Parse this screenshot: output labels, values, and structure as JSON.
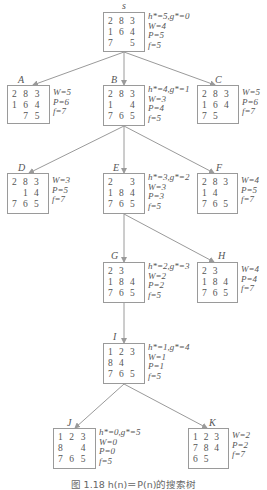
{
  "diagram": {
    "type": "search-tree",
    "caption": "图 1.18   h(n)＝P(n)的搜索树",
    "colors": {
      "edge": "#9a9a9a",
      "box_border": "#9a9a9a",
      "text": "#555555"
    },
    "nodes": [
      {
        "id": "S",
        "label": "s",
        "board": [
          [
            "2",
            "8",
            "3"
          ],
          [
            "1",
            "6",
            "4"
          ],
          [
            "7",
            "",
            "5"
          ]
        ],
        "stats": [
          "h*=5,g*=0",
          "W=4",
          "P=5",
          "f=5"
        ],
        "box": [
          103,
          12,
          42,
          40
        ],
        "labelPos": [
          122,
          1
        ]
      },
      {
        "id": "A",
        "label": "A",
        "board": [
          [
            "2",
            "8",
            "3"
          ],
          [
            "1",
            "6",
            "4"
          ],
          [
            "",
            "7",
            "5"
          ]
        ],
        "stats": [
          "W=5",
          "P=6",
          "f=7"
        ],
        "box": [
          7,
          85,
          43,
          39
        ],
        "labelPos": [
          18,
          75
        ]
      },
      {
        "id": "B",
        "label": "B",
        "board": [
          [
            "2",
            "8",
            "3"
          ],
          [
            "1",
            "",
            "4"
          ],
          [
            "7",
            "6",
            "5"
          ]
        ],
        "stats": [
          "h*=4,g*=1",
          "W=3",
          "P=4",
          "f=5"
        ],
        "box": [
          103,
          85,
          42,
          41
        ],
        "labelPos": [
          111,
          75
        ]
      },
      {
        "id": "C",
        "label": "C",
        "board": [
          [
            "2",
            "8",
            "3"
          ],
          [
            "1",
            "6",
            "4"
          ],
          [
            "7",
            "5",
            ""
          ]
        ],
        "stats": [
          "W=5",
          "P=6",
          "f=7"
        ],
        "box": [
          197,
          85,
          42,
          39
        ],
        "labelPos": [
          215,
          75
        ]
      },
      {
        "id": "D",
        "label": "D",
        "board": [
          [
            "2",
            "8",
            "3"
          ],
          [
            "",
            "1",
            "4"
          ],
          [
            "7",
            "6",
            "5"
          ]
        ],
        "stats": [
          "W=3",
          "P=5",
          "f=7"
        ],
        "box": [
          7,
          173,
          42,
          41
        ],
        "labelPos": [
          18,
          163
        ]
      },
      {
        "id": "E",
        "label": "E",
        "board": [
          [
            "2",
            "",
            "3"
          ],
          [
            "1",
            "8",
            "4"
          ],
          [
            "7",
            "6",
            "5"
          ]
        ],
        "stats": [
          "h*=3,g*=2",
          "W=3",
          "P=3",
          "f=5"
        ],
        "box": [
          103,
          173,
          42,
          41
        ],
        "labelPos": [
          113,
          163
        ]
      },
      {
        "id": "F",
        "label": "F",
        "board": [
          [
            "2",
            "8",
            "3"
          ],
          [
            "1",
            "4",
            ""
          ],
          [
            "7",
            "6",
            "5"
          ]
        ],
        "stats": [
          "W=4",
          "P=5",
          "f=7"
        ],
        "box": [
          197,
          173,
          41,
          41
        ],
        "labelPos": [
          216,
          163
        ]
      },
      {
        "id": "G",
        "label": "G",
        "board": [
          [
            "2",
            "3",
            ""
          ],
          [
            "1",
            "8",
            "4"
          ],
          [
            "7",
            "6",
            "5"
          ]
        ],
        "stats": [
          "h*=2,g*=3",
          "W=2",
          "P=2",
          "f=5"
        ],
        "box": [
          103,
          262,
          42,
          41
        ],
        "labelPos": [
          111,
          251
        ]
      },
      {
        "id": "H",
        "label": "H",
        "board": [
          [
            "2",
            "3",
            ""
          ],
          [
            "1",
            "8",
            "4"
          ],
          [
            "7",
            "6",
            "5"
          ]
        ],
        "stats": [
          "W=4",
          "P=4",
          "f=7"
        ],
        "box": [
          197,
          262,
          41,
          41
        ],
        "labelPos": [
          218,
          251
        ]
      },
      {
        "id": "I",
        "label": "I",
        "board": [
          [
            "1",
            "2",
            "3"
          ],
          [
            "8",
            "4",
            ""
          ],
          [
            "7",
            "6",
            "5"
          ]
        ],
        "stats": [
          "h*=1,g*=4",
          "W=1",
          "P=1",
          "f=5"
        ],
        "box": [
          103,
          343,
          42,
          41
        ],
        "labelPos": [
          113,
          332
        ]
      },
      {
        "id": "J",
        "label": "J",
        "board": [
          [
            "1",
            "2",
            "3"
          ],
          [
            "8",
            "",
            "4"
          ],
          [
            "7",
            "6",
            "5"
          ]
        ],
        "stats": [
          "h*=0,g*=5",
          "W=0",
          "P=0",
          "f=5"
        ],
        "box": [
          53,
          428,
          43,
          41
        ],
        "labelPos": [
          67,
          418
        ]
      },
      {
        "id": "K",
        "label": "K",
        "board": [
          [
            "1",
            "2",
            "3"
          ],
          [
            "7",
            "8",
            "4"
          ],
          [
            "6",
            "5",
            ""
          ]
        ],
        "stats": [
          "W=2",
          "P=2",
          "f=7"
        ],
        "box": [
          188,
          428,
          41,
          41
        ],
        "labelPos": [
          209,
          418
        ]
      }
    ],
    "edges": [
      {
        "from": "S",
        "to": "A",
        "line": [
          124,
          52,
          33,
          85
        ]
      },
      {
        "from": "S",
        "to": "B",
        "line": [
          124,
          52,
          124,
          85
        ]
      },
      {
        "from": "S",
        "to": "C",
        "line": [
          124,
          52,
          215,
          85
        ]
      },
      {
        "from": "B",
        "to": "D",
        "line": [
          124,
          126,
          29,
          173
        ]
      },
      {
        "from": "B",
        "to": "E",
        "line": [
          124,
          126,
          124,
          173
        ]
      },
      {
        "from": "B",
        "to": "F",
        "line": [
          124,
          126,
          214,
          173
        ]
      },
      {
        "from": "E",
        "to": "G",
        "line": [
          124,
          214,
          124,
          262
        ]
      },
      {
        "from": "E",
        "to": "H",
        "line": [
          124,
          214,
          214,
          262
        ]
      },
      {
        "from": "G",
        "to": "I",
        "line": [
          124,
          303,
          124,
          343
        ]
      },
      {
        "from": "I",
        "to": "J",
        "line": [
          124,
          384,
          75,
          428
        ]
      },
      {
        "from": "I",
        "to": "K",
        "line": [
          124,
          384,
          207,
          428
        ]
      }
    ]
  }
}
